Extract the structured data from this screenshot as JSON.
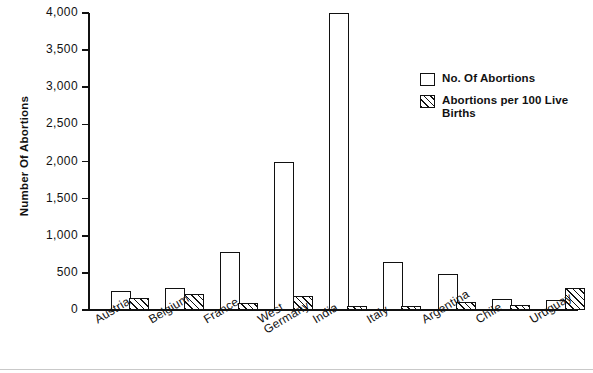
{
  "chart_data": {
    "type": "bar",
    "title": "",
    "xlabel": "",
    "ylabel": "Number Of Abortions",
    "ylim": [
      0,
      4000
    ],
    "ytick_labels": [
      "4,000",
      "3,500",
      "3,000",
      "2,500",
      "2,000",
      "1,500",
      "1,000",
      "500",
      "0"
    ],
    "ytick_values": [
      4000,
      3500,
      3000,
      2500,
      2000,
      1500,
      1000,
      500,
      0
    ],
    "grid": false,
    "legend_position": "upper right",
    "categories": [
      "Austria",
      "Belgium",
      "France",
      "West\nGermany",
      "India",
      "Italy",
      "Argentina",
      "Chile",
      "Uruguay"
    ],
    "series": [
      {
        "name": "No. Of Abortions",
        "style": "open",
        "values": [
          250,
          290,
          780,
          2000,
          4000,
          640,
          490,
          150,
          140
        ]
      },
      {
        "name": "Abortions per 100 Live Births",
        "style": "hatched",
        "values": [
          160,
          210,
          90,
          190,
          50,
          60,
          110,
          70,
          290
        ]
      }
    ]
  },
  "legend": {
    "items": [
      {
        "label": "No. Of Abortions",
        "swatch": "open-box"
      },
      {
        "label": "Abortions per 100 Live\nBirths",
        "swatch": "hatched-box"
      }
    ]
  },
  "colors": {
    "ink": "#111111",
    "background": "#ffffff",
    "footer_rule": "#c9c9c9"
  }
}
